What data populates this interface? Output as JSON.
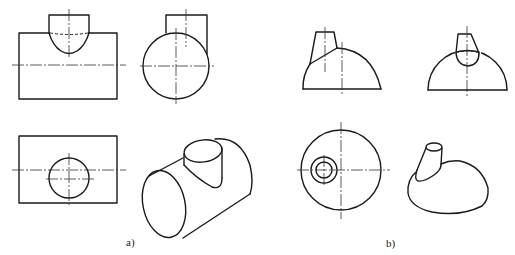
{
  "figure": {
    "line_color": "#1a1a1a",
    "background": "#ffffff"
  },
  "panels": [
    {
      "id": "a",
      "caption": "a)",
      "subject": "Two perpendicular cylinders intersecting (T-pipe)",
      "views": [
        {
          "name": "front-view",
          "label": "Front view"
        },
        {
          "name": "side-view",
          "label": "Left side view"
        },
        {
          "name": "top-view",
          "label": "Top view"
        },
        {
          "name": "isometric-view",
          "label": "Isometric view"
        }
      ]
    },
    {
      "id": "b",
      "caption": "b)",
      "subject": "Truncated cone intersecting a hemisphere (off-center)",
      "views": [
        {
          "name": "front-view",
          "label": "Front view"
        },
        {
          "name": "side-view",
          "label": "Left side view"
        },
        {
          "name": "top-view",
          "label": "Top view"
        },
        {
          "name": "isometric-view",
          "label": "Isometric view"
        }
      ]
    }
  ]
}
